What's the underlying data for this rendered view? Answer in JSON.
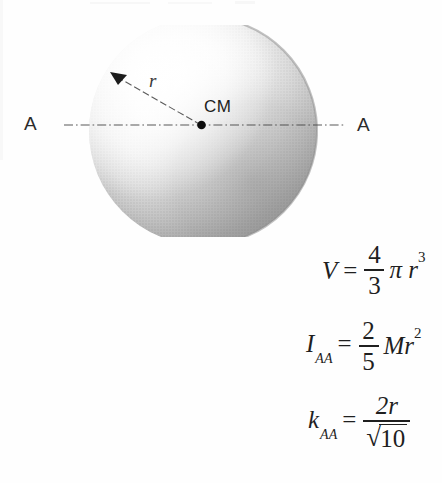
{
  "figure": {
    "type": "solid-sphere-moment-of-inertia-diagram",
    "axis_label_left": "A",
    "axis_label_right": "A",
    "center_label": "CM",
    "radius_label": "r",
    "colors": {
      "ink": "#1f1f1f",
      "axis_line": "#555555",
      "sphere_light": "#fdfdfd",
      "sphere_mid": "#bdbdbd",
      "sphere_dark": "#8a8a8a",
      "background": "#fefefe"
    },
    "sphere": {
      "center_x": 203,
      "center_y": 131,
      "radius_px": 114
    }
  },
  "formulas": [
    {
      "id": "volume",
      "lhs_symbol": "V",
      "lhs_sub": "",
      "equals": "=",
      "numerator": "4",
      "denominator": "3",
      "rhs": "π r",
      "rhs_exponent": "3",
      "plain": "V = (4/3) π r³"
    },
    {
      "id": "inertia",
      "lhs_symbol": "I",
      "lhs_sub": "AA",
      "equals": "=",
      "numerator": "2",
      "denominator": "5",
      "rhs": "Mr",
      "rhs_exponent": "2",
      "plain": "I_AA = (2/5) M r²"
    },
    {
      "id": "radius-of-gyration",
      "lhs_symbol": "k",
      "lhs_sub": "AA",
      "equals": "=",
      "numerator": "2r",
      "denominator_radicand": "10",
      "radical_sign": "√",
      "plain": "k_AA = 2r / √10"
    }
  ]
}
